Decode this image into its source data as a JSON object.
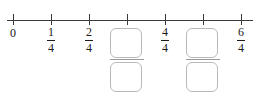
{
  "exercise": {
    "type": "number-line-fractions",
    "axis": {
      "line_color": "#3a3a3a",
      "tick_color": "#3a3a3a",
      "x_start": 7,
      "x_end": 253,
      "y": 20,
      "tick_height": 11,
      "tick_spacing": 38,
      "first_tick_x": 13,
      "tick_count": 7
    },
    "text_color": "#1b1b1b",
    "box_border_color": "#b9b9b9",
    "ticks": [
      {
        "index": 0,
        "x": 13,
        "kind": "integer",
        "label": "0",
        "value": "0"
      },
      {
        "index": 1,
        "x": 51,
        "kind": "fraction",
        "numerator": "1",
        "denominator": "4"
      },
      {
        "index": 2,
        "x": 89,
        "kind": "fraction",
        "numerator": "2",
        "denominator": "4"
      },
      {
        "index": 3,
        "x": 127,
        "kind": "input",
        "numerator": "",
        "denominator": "",
        "numerator_placeholder": "",
        "denominator_placeholder": ""
      },
      {
        "index": 4,
        "x": 165,
        "kind": "fraction",
        "numerator": "4",
        "denominator": "4"
      },
      {
        "index": 5,
        "x": 203,
        "kind": "input",
        "numerator": "",
        "denominator": "",
        "numerator_placeholder": "",
        "denominator_placeholder": ""
      },
      {
        "index": 6,
        "x": 241,
        "kind": "fraction",
        "numerator": "6",
        "denominator": "4"
      }
    ]
  }
}
